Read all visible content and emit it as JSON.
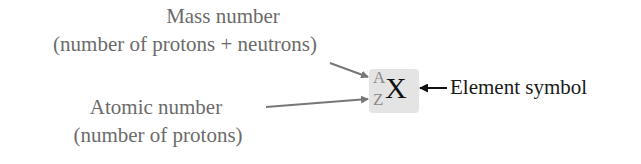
{
  "diagram": {
    "type": "nuclide notation",
    "mass_number_label": {
      "line1": "Mass number",
      "line2": "(number of protons + neutrons)"
    },
    "atomic_number_label": {
      "line1": "Atomic number",
      "line2": "(number of protons)"
    },
    "element_symbol_label": "Element symbol",
    "notation": {
      "superscript": "A",
      "subscript": "Z",
      "symbol": "X"
    },
    "colors": {
      "label_gray": "#6b6b6b",
      "arrow_gray": "#777777",
      "box_fill": "#e4e4e4",
      "symbol_black": "#111111"
    }
  }
}
